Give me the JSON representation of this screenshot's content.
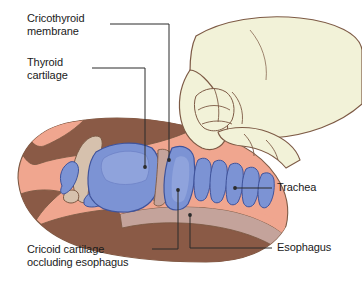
{
  "figure": {
    "view": "lateral sagittal cutaway of the neck with a hand applying downward pressure"
  },
  "labels": {
    "cricothyroid_membrane": "Cricothyroid\nmembrane",
    "thyroid_cartilage": "Thyroid\ncartilage",
    "cricoid_cartilage": "Cricoid cartilage\noccluding esophagus",
    "trachea": "Trachea",
    "esophagus": "Esophagus"
  },
  "colors": {
    "background": "#ffffff",
    "skin_light": "#f0a68f",
    "skin_dark": "#8a5a46",
    "cartilage_blue": "#7c93d4",
    "cartilage_blue_dark": "#5d74bb",
    "bone_tan": "#d6c1ad",
    "hand_cream": "#f2f2d8",
    "hand_outline": "#7d5a45",
    "mucosa_mauve": "#c4a39b",
    "leader_line": "#2b2b2b",
    "text": "#1a1a1a"
  },
  "structures": [
    {
      "name": "hand",
      "description": "operator hand pressing cricoid, pale cream with brown outlines"
    },
    {
      "name": "thyroid-cartilage",
      "description": "large blue shield-shaped cartilage in center"
    },
    {
      "name": "cricoid-cartilage",
      "description": "blue ring cartilage posterior-inferior to thyroid"
    },
    {
      "name": "cricothyroid-membrane",
      "description": "gap between thyroid and cricoid cartilage"
    },
    {
      "name": "hyoid-bone",
      "description": "tan curved bone superior to thyroid cartilage"
    },
    {
      "name": "tracheal-rings",
      "description": "series of blue C-shaped rings inferior to cricoid"
    },
    {
      "name": "esophagus",
      "description": "mauve tube posterior to trachea, compressed by cricoid"
    },
    {
      "name": "neck-soft-tissue",
      "description": "salmon and dark-brown tissue planes of neck"
    }
  ]
}
